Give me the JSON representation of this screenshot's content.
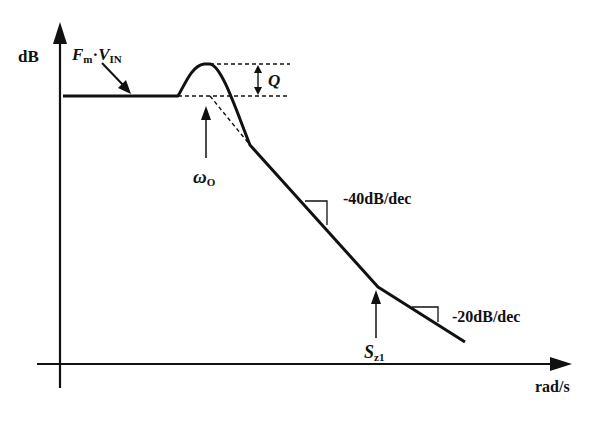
{
  "diagram": {
    "type": "bode-magnitude-asymptotic",
    "axes": {
      "y_label": "dB",
      "x_label": "rad/s"
    },
    "labels": {
      "dc_gain": {
        "main": "F",
        "sub1": "m",
        "dot": "·",
        "main2": "V",
        "sub2": "IN"
      },
      "peak": "Q",
      "omega": {
        "main": "ω",
        "sub": "O"
      },
      "slope1": "-40dB/dec",
      "slope2": "-20dB/dec",
      "zero": {
        "main": "S",
        "sub": "z1"
      }
    },
    "colors": {
      "stroke": "#111111",
      "background": "#ffffff"
    }
  }
}
